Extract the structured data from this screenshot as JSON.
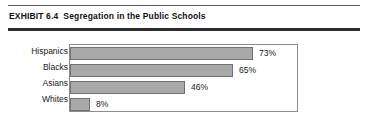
{
  "exhibit": {
    "number_label": "EXHIBIT 6.4",
    "title": "Segregation in the Public Schools"
  },
  "chart_data": {
    "type": "bar",
    "orientation": "horizontal",
    "title": "Segregation in the Public Schools",
    "xlabel": "",
    "ylabel": "",
    "xlim": [
      0,
      100
    ],
    "grid": false,
    "legend": "none",
    "bar_color": "#a9a9a9",
    "bar_border_color": "#6f7173",
    "categories": [
      "Hispanics",
      "Blacks",
      "Asians",
      "Whites"
    ],
    "values": [
      73,
      65,
      46,
      8
    ],
    "value_labels": [
      "73%",
      "65%",
      "46%",
      "8%"
    ],
    "value_unit": "%"
  }
}
